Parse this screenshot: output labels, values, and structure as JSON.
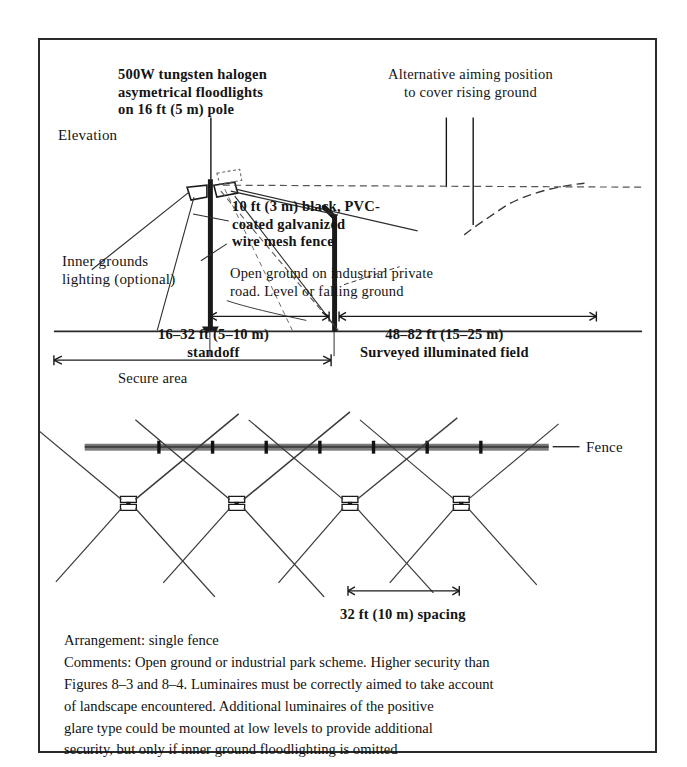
{
  "figure": {
    "elevation": {
      "view_label": "Elevation",
      "floodlight_note": "500W tungsten halogen\nasymetrical floodlights\non 16 ft (5 m) pole",
      "alt_aim_note": "Alternative aiming position\nto cover rising ground",
      "fence_spec_note": "10 ft (3 m) black, PVC-\ncoated galvanized\nwire mesh fence",
      "inner_lighting_note": "Inner grounds\nlighting (optional)",
      "open_ground_note": "Open ground on industrial private\nroad. Level or falling ground",
      "dimensions": {
        "standoff": "16–32 ft (5–10 m)\nstandoff",
        "surveyed_field": "48–82 ft (15–25 m)\nSurveyed illuminated field",
        "secure_area": "Secure area"
      }
    },
    "plan": {
      "fence_label": "Fence",
      "spacing_label": "32 ft (10 m) spacing",
      "luminaire_count": 4,
      "fence_post_count": 7
    },
    "notes": {
      "arrangement": "Arrangement: single fence",
      "comments": "Comments: Open ground or industrial park scheme. Higher security than\nFigures 8–3 and 8–4. Luminaires must be correctly aimed to take account\nof landscape encountered. Additional luminaires of the positive\nglare type could be mounted at low levels to provide additional\nsecurity, but only if inner ground floodlighting is omitted"
    },
    "colors": {
      "ink": "#141414",
      "border": "#2a2a2a",
      "fence_band": "#6b6b6b",
      "beam": "#3a3a3a"
    }
  }
}
